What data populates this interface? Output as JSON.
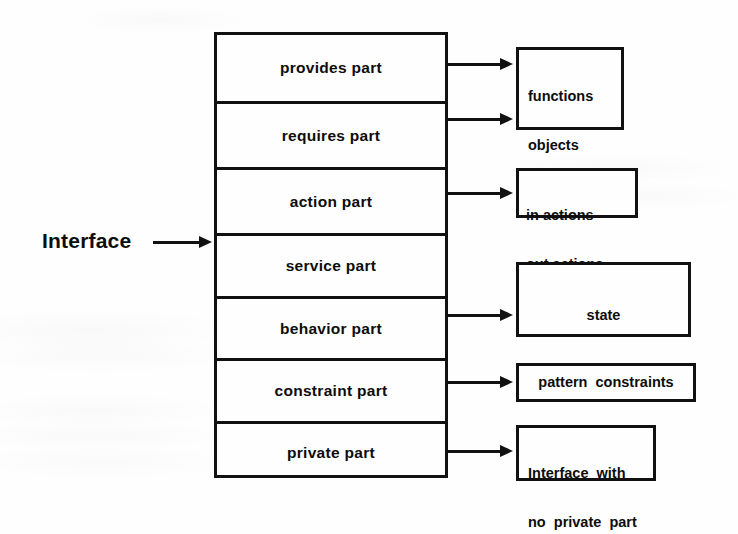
{
  "diagram": {
    "ink_color": "#111111",
    "background_color": "#fefefe",
    "left_label": "Interface",
    "left_arrow_icon": "right-arrow-icon"
  },
  "main_column": {
    "name": "Interface",
    "parts": [
      {
        "label": "provides part",
        "height_px": 66
      },
      {
        "label": "requires part",
        "height_px": 66
      },
      {
        "label": "action part",
        "height_px": 66
      },
      {
        "label": "service part",
        "height_px": 63
      },
      {
        "label": "behavior part",
        "height_px": 62
      },
      {
        "label": "constraint part",
        "height_px": 63
      },
      {
        "label": "private part",
        "height_px": 60
      }
    ]
  },
  "detail_boxes": [
    {
      "id": "provides-requires-detail",
      "lines": [
        "functions",
        "objects",
        "types"
      ],
      "from_parts": [
        "provides part",
        "requires part"
      ]
    },
    {
      "id": "action-detail",
      "lines": [
        "in actions",
        "out actions"
      ],
      "from_parts": [
        "action part"
      ]
    },
    {
      "id": "behavior-detail",
      "lines": [
        "state",
        "state  transitions"
      ],
      "from_parts": [
        "behavior part"
      ]
    },
    {
      "id": "constraint-detail",
      "lines": [
        "pattern  constraints"
      ],
      "from_parts": [
        "constraint part"
      ]
    },
    {
      "id": "private-detail",
      "lines": [
        "Interface  with",
        "no  private  part"
      ],
      "from_parts": [
        "private part"
      ]
    }
  ],
  "connectors": [
    {
      "id": "provides-arrow",
      "icon": "right-arrow-icon"
    },
    {
      "id": "requires-arrow",
      "icon": "right-arrow-icon"
    },
    {
      "id": "action-arrow",
      "icon": "right-arrow-icon"
    },
    {
      "id": "behavior-arrow",
      "icon": "right-arrow-icon"
    },
    {
      "id": "constraint-arrow",
      "icon": "right-arrow-icon"
    },
    {
      "id": "private-arrow",
      "icon": "right-arrow-icon"
    },
    {
      "id": "interface-arrow",
      "icon": "right-arrow-icon"
    }
  ]
}
